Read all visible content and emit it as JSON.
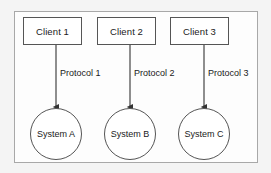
{
  "diagram": {
    "boundary": {
      "name": "system-boundary"
    },
    "colors": {
      "node_stroke": "#555555",
      "boundary_stroke": "#a8a8a8",
      "node_fill": "#ffffff",
      "canvas_background": "#f4f4f4",
      "text": "#1a1a1a"
    },
    "clients": [
      {
        "label": "Client 1",
        "x": 23,
        "y": 17
      },
      {
        "label": "Client 2",
        "x": 97,
        "y": 17
      },
      {
        "label": "Client 3",
        "x": 170,
        "y": 17
      }
    ],
    "systems": [
      {
        "label": "System A",
        "cx": 56,
        "cy": 134
      },
      {
        "label": "System B",
        "cx": 130,
        "cy": 134
      },
      {
        "label": "System C",
        "cx": 204,
        "cy": 134
      }
    ],
    "connections": [
      {
        "label": "Protocol 1",
        "from": "Client 1",
        "to": "System A",
        "x": 56,
        "y1": 45,
        "y2": 109,
        "label_x": 60,
        "label_y": 74
      },
      {
        "label": "Protocol 2",
        "from": "Client 2",
        "to": "System B",
        "x": 130,
        "y1": 45,
        "y2": 109,
        "label_x": 134,
        "label_y": 74
      },
      {
        "label": "Protocol 3",
        "from": "Client 3",
        "to": "System C",
        "x": 204,
        "y1": 45,
        "y2": 109,
        "label_x": 208,
        "label_y": 74
      }
    ]
  }
}
